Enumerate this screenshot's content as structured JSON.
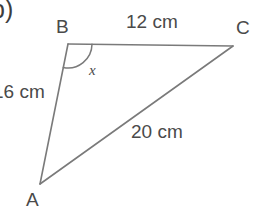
{
  "figure": {
    "part_label": "b)",
    "shape": "triangle",
    "vertices": [
      {
        "name": "A",
        "label": "A",
        "x": 40,
        "y": 184
      },
      {
        "name": "B",
        "label": "B",
        "x": 68,
        "y": 44
      },
      {
        "name": "C",
        "label": "C",
        "x": 233,
        "y": 46
      }
    ],
    "sides": [
      {
        "name": "BC",
        "label": "12 cm",
        "value": 12,
        "unit": "cm"
      },
      {
        "name": "AB",
        "label": "16 cm",
        "value": 16,
        "unit": "cm"
      },
      {
        "name": "AC",
        "label": "20 cm",
        "value": 20,
        "unit": "cm"
      }
    ],
    "angle": {
      "at_vertex": "B",
      "label": "x",
      "arc_radius": 24
    },
    "colors": {
      "stroke": "#7a7a7a",
      "text": "#4a4a4a",
      "part_text": "#3d3d3d",
      "background": "#ffffff"
    }
  }
}
